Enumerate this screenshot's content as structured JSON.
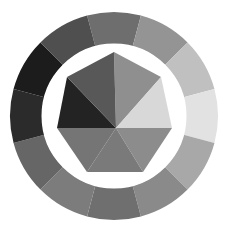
{
  "figure": {
    "name": "grayscale-color-wheel-gem",
    "width": 228,
    "height": 234,
    "background_color": "#ffffff",
    "center": {
      "x": 114,
      "y": 116
    },
    "outer_radius": 104,
    "ring_inner_radius": 72,
    "gap_ring_color": "#ffffff",
    "gap_ring_inner_radius": 66,
    "inner_polygon_radius": 64,
    "inner_polygon_sides": 7,
    "inner_polygon_rotation_deg": -90,
    "facet_apex": {
      "x": 116,
      "y": 128
    }
  },
  "chart_data": {
    "type": "pie",
    "xlabel": "",
    "ylabel": "",
    "legend_position": "none",
    "grid": false,
    "segment_count": 12,
    "segment_angle_deg": 30,
    "start_angle_deg": -105,
    "categories": [
      "seg-01",
      "seg-02",
      "seg-03",
      "seg-04",
      "seg-05",
      "seg-06",
      "seg-07",
      "seg-08",
      "seg-09",
      "seg-10",
      "seg-11",
      "seg-12"
    ],
    "values": [
      30,
      30,
      30,
      30,
      30,
      30,
      30,
      30,
      30,
      30,
      30,
      30
    ],
    "outer_ring": {
      "label": "outer-ring-segments",
      "slices": [
        {
          "name": "seg-01",
          "start_deg": -105,
          "end_deg": -75,
          "color": "#6e6e6e",
          "value": 30
        },
        {
          "name": "seg-02",
          "start_deg": -75,
          "end_deg": -45,
          "color": "#949494",
          "value": 30
        },
        {
          "name": "seg-03",
          "start_deg": -45,
          "end_deg": -15,
          "color": "#c0c0c0",
          "value": 30
        },
        {
          "name": "seg-04",
          "start_deg": -15,
          "end_deg": 15,
          "color": "#e2e2e2",
          "value": 30
        },
        {
          "name": "seg-05",
          "start_deg": 15,
          "end_deg": 45,
          "color": "#a8a8a8",
          "value": 30
        },
        {
          "name": "seg-06",
          "start_deg": 45,
          "end_deg": 75,
          "color": "#8a8a8a",
          "value": 30
        },
        {
          "name": "seg-07",
          "start_deg": 75,
          "end_deg": 105,
          "color": "#6f6f6f",
          "value": 30
        },
        {
          "name": "seg-08",
          "start_deg": 105,
          "end_deg": 135,
          "color": "#7c7c7c",
          "value": 30
        },
        {
          "name": "seg-09",
          "start_deg": 135,
          "end_deg": 165,
          "color": "#666666",
          "value": 30
        },
        {
          "name": "seg-10",
          "start_deg": 165,
          "end_deg": 195,
          "color": "#2b2b2b",
          "value": 30
        },
        {
          "name": "seg-11",
          "start_deg": 195,
          "end_deg": 225,
          "color": "#1c1c1c",
          "value": 30
        },
        {
          "name": "seg-12",
          "start_deg": 225,
          "end_deg": 255,
          "color": "#4f4f4f",
          "value": 30
        }
      ]
    },
    "inner_gem": {
      "label": "inner-gem-facets",
      "facets": [
        {
          "name": "facet-01",
          "color": "#8f8f8f",
          "points": "114,52 161,77 116,128"
        },
        {
          "name": "facet-02",
          "color": "#d8d8d8",
          "points": "161,77 172,128 116,128"
        },
        {
          "name": "facet-03",
          "color": "#8c8c8c",
          "points": "172,128 143,172 116,128"
        },
        {
          "name": "facet-04",
          "color": "#7a7a7a",
          "points": "143,172 87,172 116,128"
        },
        {
          "name": "facet-05",
          "color": "#757575",
          "points": "87,172 57,128 116,128"
        },
        {
          "name": "facet-06",
          "color": "#232323",
          "points": "57,128 67,77 116,128"
        },
        {
          "name": "facet-07",
          "color": "#585858",
          "points": "67,77 114,52 116,128"
        }
      ]
    }
  }
}
